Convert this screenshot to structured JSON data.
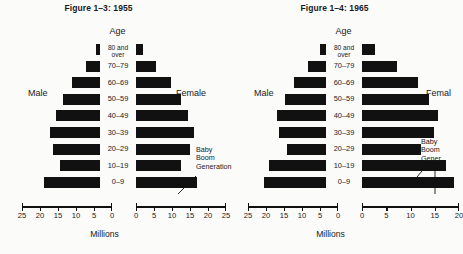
{
  "chart_data": [
    {
      "type": "bar",
      "title": "Figure 1–3: 1955",
      "subtype": "population-pyramid",
      "xlabel": "Millions",
      "ylabel": "Age",
      "categories": [
        "0–9",
        "10–19",
        "20–29",
        "30–39",
        "40–49",
        "50–59",
        "60–69",
        "70–79",
        "80 and over"
      ],
      "series": [
        {
          "name": "Male",
          "values": [
            17.8,
            12.8,
            15.2,
            16.0,
            14.0,
            11.8,
            9.0,
            4.6,
            1.4
          ]
        },
        {
          "name": "Female",
          "values": [
            17.0,
            12.4,
            15.0,
            16.2,
            14.4,
            12.4,
            9.8,
            5.6,
            2.0
          ]
        }
      ],
      "male_axis_ticks": [
        25,
        20,
        15,
        10,
        5,
        0
      ],
      "female_axis_ticks": [
        0,
        5,
        10,
        15,
        20,
        25
      ],
      "male_axis_range": [
        25,
        0
      ],
      "female_axis_range": [
        0,
        25
      ],
      "grid": false,
      "legend": "none",
      "annotations": [
        {
          "text": "Baby Boom Generation",
          "target_category": "0–9",
          "target_series": "Female"
        }
      ]
    },
    {
      "type": "bar",
      "title": "Figure 1–4: 1965",
      "subtype": "population-pyramid",
      "xlabel": "Millions",
      "ylabel": "Age",
      "categories": [
        "0–9",
        "10–19",
        "20–29",
        "30–39",
        "40–49",
        "50–59",
        "60–69",
        "70–79",
        "80 and over"
      ],
      "series": [
        {
          "name": "Male",
          "values": [
            19.8,
            18.2,
            12.4,
            15.0,
            15.6,
            13.2,
            10.2,
            5.8,
            1.8
          ]
        },
        {
          "name": "Female",
          "values": [
            19.2,
            17.6,
            12.2,
            15.0,
            15.8,
            14.0,
            11.6,
            7.2,
            2.8
          ]
        }
      ],
      "male_axis_ticks": [
        25,
        20,
        15,
        10,
        5,
        0
      ],
      "female_axis_ticks": [
        0,
        5,
        10,
        15,
        20
      ],
      "male_axis_range": [
        25,
        0
      ],
      "female_axis_range": [
        0,
        20
      ],
      "grid": false,
      "legend": "none",
      "annotations": [
        {
          "text": "Baby Boom Generation",
          "target_category": "0–9",
          "target_series": "Female"
        },
        {
          "text": "Baby Boom Generation",
          "target_category": "10–19",
          "target_series": "Female"
        }
      ]
    }
  ],
  "panels": [
    {
      "title": "Figure 1–3: 1955",
      "age_header": "Age",
      "male_label": "Male",
      "female_label": "Female",
      "x_axis_label": "Millions",
      "annotation_lines": [
        "Baby",
        "Boom",
        "Generation"
      ]
    },
    {
      "title": "Figure 1–4: 1965",
      "age_header": "Age",
      "male_label": "Male",
      "female_label": "Femal",
      "x_axis_label": "Millions",
      "annotation_lines": [
        "Baby",
        "Boom",
        "Gener"
      ]
    }
  ]
}
